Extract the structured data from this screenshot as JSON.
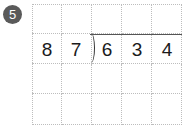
{
  "problem": {
    "number": "5",
    "divisor": [
      "8",
      "7"
    ],
    "dividend": [
      "6",
      "3",
      "4"
    ]
  },
  "grid": {
    "columns": 5,
    "rows": 4
  },
  "colors": {
    "badge": "#5a5a5a",
    "grid_line": "#bdbdbd",
    "text": "#1a1a1a"
  }
}
